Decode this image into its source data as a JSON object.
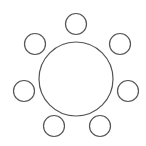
{
  "diagram": {
    "title": "",
    "table": {
      "shape": "circle",
      "label": ""
    },
    "seat_count": 7,
    "seats": [
      {
        "id": "seat-top"
      },
      {
        "id": "seat-top-right"
      },
      {
        "id": "seat-right"
      },
      {
        "id": "seat-bottom-right"
      },
      {
        "id": "seat-bottom-left"
      },
      {
        "id": "seat-left"
      },
      {
        "id": "seat-top-left"
      }
    ],
    "colors": {
      "stroke": "#555555",
      "fill": "#ffffff",
      "background": "#ffffff"
    }
  }
}
